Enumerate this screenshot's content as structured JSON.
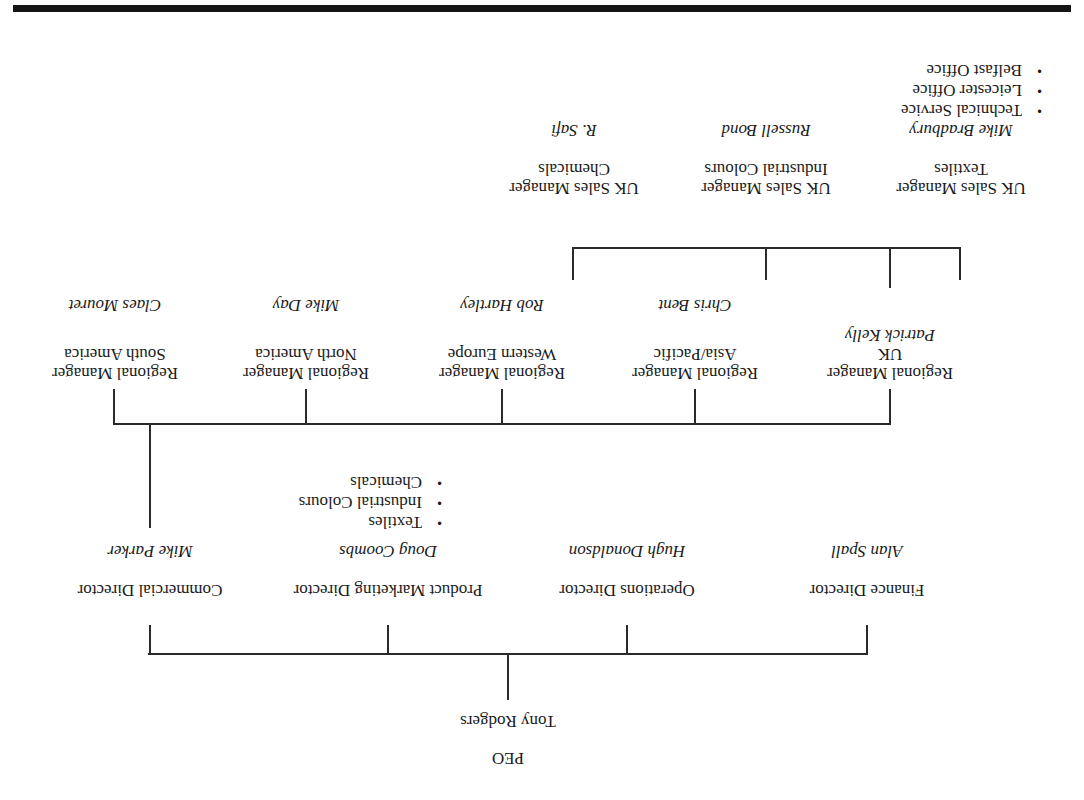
{
  "orientation": "rotated-180",
  "ceo": {
    "title": "PEO",
    "name": "Tony Rodgers"
  },
  "directors": [
    {
      "title": "Finance Director",
      "name": "Alan Spall"
    },
    {
      "title": "Operations Director",
      "name": "Hugh Donaldson"
    },
    {
      "title": "Product Marketing Director",
      "name": "Doug Coombs",
      "bullets": [
        "Textiles",
        "Industrial Colours",
        "Chemicals"
      ]
    },
    {
      "title": "Commercial Director",
      "name": "Mike Parker"
    }
  ],
  "regional_managers": [
    {
      "title": "Regional Manager",
      "region": "UK",
      "name": "Patrick Kelly"
    },
    {
      "title": "Regional Manager",
      "region": "Asia/Pacific",
      "name": "Chris Bent"
    },
    {
      "title": "Regional Manager",
      "region": "Western Europe",
      "name": "Rob Hartley"
    },
    {
      "title": "Regional Manager",
      "region": "North America",
      "name": "Mike Day"
    },
    {
      "title": "Regional Manager",
      "region": "South America",
      "name": "Claes Mouret"
    }
  ],
  "uk_sales_managers": [
    {
      "title": "UK Sales Manager",
      "division": "Textiles",
      "name": "Mike Bradbury",
      "bullets": [
        "Technical Service",
        "Leicester Office",
        "Belfast Office"
      ]
    },
    {
      "title": "UK Sales Manager",
      "division": "Industrial Colours",
      "name": "Russell Bond"
    },
    {
      "title": "UK Sales Manager",
      "division": "Chemicals",
      "name": "R. Safi"
    }
  ],
  "colors": {
    "line": "#2a2a2a",
    "bar": "#151515",
    "text": "#1a1a1a"
  }
}
